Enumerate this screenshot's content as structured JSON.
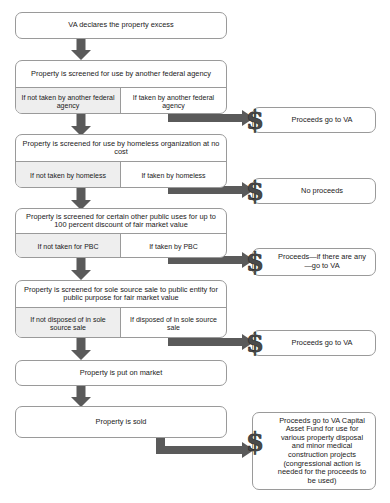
{
  "diagram": {
    "type": "flowchart",
    "colors": {
      "box_border": "#9a9a9a",
      "left_cell_fill": "#eeeeee",
      "arrow": "#5a5a5a",
      "text": "#1a1a1a",
      "background": "#ffffff"
    },
    "nodes": [
      {
        "id": "start",
        "kind": "simple",
        "label": "VA declares the property excess"
      },
      {
        "id": "federal",
        "kind": "split",
        "header": "Property is screened for use by another federal agency",
        "left": "If not taken by another federal agency",
        "right": "If taken by another federal agency"
      },
      {
        "id": "homeless",
        "kind": "split",
        "header": "Property is screened for use by homeless organization at no cost",
        "left": "If not taken by homeless",
        "right": "If taken by homeless"
      },
      {
        "id": "pbc",
        "kind": "split",
        "header": "Property is screened for certain other public uses for up to 100 percent discount of fair market value",
        "left": "If not taken for PBC",
        "right": "If taken by PBC"
      },
      {
        "id": "solesource",
        "kind": "split",
        "header": "Property is screened for sole source sale to public entity for public purpose for fair market value",
        "left": "If not disposed of in sole source sale",
        "right": "If disposed of in sole source sale"
      },
      {
        "id": "market",
        "kind": "simple",
        "label": "Property is put on market"
      },
      {
        "id": "sold",
        "kind": "simple",
        "label": "Property is sold"
      }
    ],
    "outcomes": [
      {
        "id": "outcome-federal",
        "icon": "dollar-icon",
        "label": "Proceeds go to VA"
      },
      {
        "id": "outcome-homeless",
        "icon": "dollar-icon",
        "label": "No proceeds"
      },
      {
        "id": "outcome-pbc",
        "icon": "dollar-icon",
        "label": "Proceeds—if there are any—go to VA"
      },
      {
        "id": "outcome-solesource",
        "icon": "dollar-icon",
        "label": "Proceeds go to VA"
      },
      {
        "id": "outcome-sold",
        "icon": "dollar-icon",
        "label": "Proceeds go to VA Capital Asset Fund for use for various property disposal and minor medical construction projects (congressional action is needed for the proceeds to be used)"
      }
    ]
  }
}
